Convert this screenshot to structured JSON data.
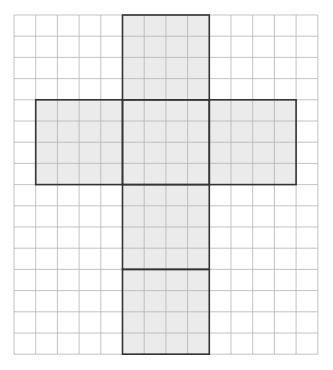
{
  "diagram": {
    "type": "cube-net-on-grid",
    "grid": {
      "origin_x": 14,
      "origin_y": 15,
      "cols": 14,
      "rows": 16,
      "cell_w": 21.7,
      "cell_h": 21.2,
      "line_color": "#b4b4b4",
      "background": "#ffffff"
    },
    "net": {
      "fill_color": "#ebebeb",
      "stroke_color": "#333333",
      "faces": [
        {
          "name": "top-face",
          "col": 5,
          "row": 0,
          "w": 4,
          "h": 4
        },
        {
          "name": "left-face",
          "col": 1,
          "row": 4,
          "w": 4,
          "h": 4
        },
        {
          "name": "center-face",
          "col": 5,
          "row": 4,
          "w": 4,
          "h": 4
        },
        {
          "name": "right-face",
          "col": 9,
          "row": 4,
          "w": 4,
          "h": 4
        },
        {
          "name": "lower-face",
          "col": 5,
          "row": 8,
          "w": 4,
          "h": 4
        },
        {
          "name": "bottom-face",
          "col": 5,
          "row": 12,
          "w": 4,
          "h": 4
        }
      ]
    }
  }
}
